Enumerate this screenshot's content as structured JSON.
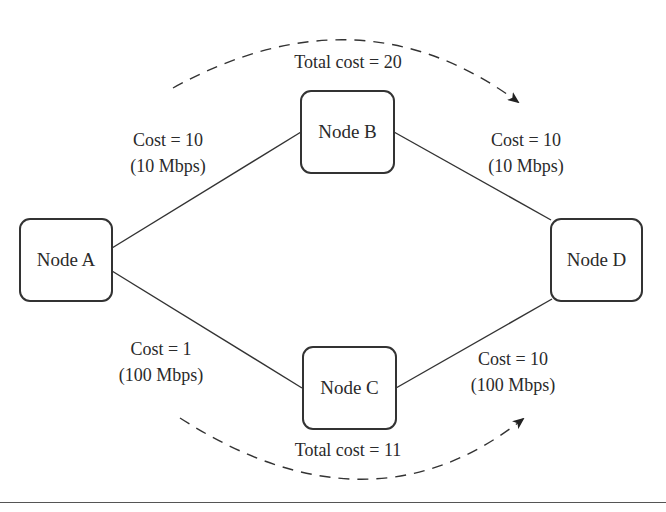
{
  "diagram": {
    "nodes": [
      {
        "id": "A",
        "label": "Node A"
      },
      {
        "id": "B",
        "label": "Node B"
      },
      {
        "id": "C",
        "label": "Node C"
      },
      {
        "id": "D",
        "label": "Node D"
      }
    ],
    "links": [
      {
        "from": "A",
        "to": "B",
        "cost": "Cost = 10",
        "bandwidth": "(10 Mbps)"
      },
      {
        "from": "B",
        "to": "D",
        "cost": "Cost = 10",
        "bandwidth": "(10 Mbps)"
      },
      {
        "from": "A",
        "to": "C",
        "cost": "Cost = 1",
        "bandwidth": "(100 Mbps)"
      },
      {
        "from": "C",
        "to": "D",
        "cost": "Cost = 10",
        "bandwidth": "(100 Mbps)"
      }
    ],
    "paths": [
      {
        "route": "A-B-D",
        "label": "Total cost = 20",
        "style": "dashed-arrow-top"
      },
      {
        "route": "A-C-D",
        "label": "Total cost = 11",
        "style": "dashed-arrow-bottom"
      }
    ],
    "colors": {
      "stroke": "#333333",
      "text": "#2a2a2a",
      "background": "#ffffff"
    }
  }
}
